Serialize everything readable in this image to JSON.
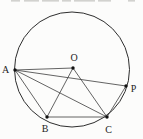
{
  "figure": {
    "background_color": "#fcfcfb",
    "stroke_color": "#3c3c3c",
    "circle_stroke_color": "#2e2e2e",
    "label_color": "#1d1d1d",
    "dot_color": "#111111",
    "circle": {
      "cx": 72,
      "cy": 69.5,
      "r": 57.5
    },
    "points": {
      "O": {
        "x": 73,
        "y": 68,
        "label": "O",
        "label_x": 74,
        "label_y": 61
      },
      "A": {
        "x": 15,
        "y": 70,
        "label": "A",
        "label_x": 5.5,
        "label_y": 73
      },
      "P": {
        "x": 126,
        "y": 86,
        "label": "P",
        "label_x": 133.5,
        "label_y": 92
      },
      "B": {
        "x": 47,
        "y": 117,
        "label": "B",
        "label_x": 45,
        "label_y": 131.5
      },
      "C": {
        "x": 107,
        "y": 117,
        "label": "C",
        "label_x": 108.5,
        "label_y": 132.5
      }
    },
    "segments": [
      [
        "A",
        "O"
      ],
      [
        "A",
        "P"
      ],
      [
        "A",
        "B"
      ],
      [
        "A",
        "C"
      ],
      [
        "O",
        "B"
      ],
      [
        "O",
        "C"
      ],
      [
        "B",
        "C"
      ],
      [
        "C",
        "P"
      ]
    ],
    "top_clipped_text_artifact": {
      "color": "#b5b5b2",
      "dashes": [
        {
          "x": 11,
          "w": 9
        },
        {
          "x": 24,
          "w": 15
        },
        {
          "x": 42,
          "w": 17
        },
        {
          "x": 62,
          "w": 9
        },
        {
          "x": 74,
          "w": 21
        },
        {
          "x": 98,
          "w": 13
        },
        {
          "x": 128,
          "w": 7
        }
      ]
    }
  }
}
